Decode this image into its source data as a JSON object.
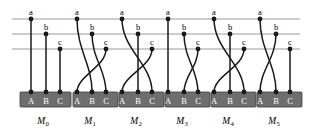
{
  "figure": {
    "type": "diagram",
    "colors": {
      "gridline": "#9b9b9b",
      "wire": "#1a1a1a",
      "node": "#1a1a1a",
      "bar_fill": "#6e6e6e",
      "bar_stroke": "#3c3c3c",
      "out_label": "#ffffff",
      "background": "#ffffff"
    },
    "grid": {
      "rows": 3,
      "row_y": [
        19,
        34,
        49
      ],
      "x_start": 12,
      "x_end": 300
    },
    "input_labels": [
      "a",
      "b",
      "c"
    ],
    "output_labels": [
      "A",
      "B",
      "C"
    ],
    "bar": {
      "top": 92,
      "height": 15
    },
    "modules": [
      {
        "name": "M",
        "subscript": "0",
        "label_x": 43,
        "inputs_x": [
          31,
          46,
          60
        ],
        "outputs_x": [
          31,
          46,
          60
        ],
        "bar_x": 20,
        "bar_width": 51,
        "mapping": [
          {
            "from": "a",
            "to": "A"
          },
          {
            "from": "b",
            "to": "B"
          },
          {
            "from": "c",
            "to": "C"
          }
        ]
      },
      {
        "name": "M",
        "subscript": "1",
        "label_x": 90,
        "inputs_x": [
          77,
          92,
          106
        ],
        "outputs_x": [
          77,
          92,
          106
        ],
        "bar_x": 73,
        "bar_width": 45,
        "mapping": [
          {
            "from": "a",
            "to": "B"
          },
          {
            "from": "b",
            "to": "C"
          },
          {
            "from": "c",
            "to": "A"
          }
        ]
      },
      {
        "name": "M",
        "subscript": "2",
        "label_x": 136,
        "inputs_x": [
          122,
          138,
          152
        ],
        "outputs_x": [
          122,
          138,
          152
        ],
        "bar_x": 119,
        "bar_width": 45,
        "mapping": [
          {
            "from": "a",
            "to": "C"
          },
          {
            "from": "b",
            "to": "B"
          },
          {
            "from": "c",
            "to": "A"
          }
        ]
      },
      {
        "name": "M",
        "subscript": "3",
        "label_x": 182,
        "inputs_x": [
          168,
          184,
          198
        ],
        "outputs_x": [
          168,
          184,
          198
        ],
        "bar_x": 165,
        "bar_width": 45,
        "mapping": [
          {
            "from": "a",
            "to": "A"
          },
          {
            "from": "b",
            "to": "C"
          },
          {
            "from": "c",
            "to": "B"
          }
        ]
      },
      {
        "name": "M",
        "subscript": "4",
        "label_x": 228,
        "inputs_x": [
          214,
          230,
          244
        ],
        "outputs_x": [
          214,
          230,
          244
        ],
        "bar_x": 211,
        "bar_width": 45,
        "mapping": [
          {
            "from": "a",
            "to": "C"
          },
          {
            "from": "b",
            "to": "B"
          },
          {
            "from": "c",
            "to": "A"
          }
        ]
      },
      {
        "name": "M",
        "subscript": "5",
        "label_x": 274,
        "inputs_x": [
          260,
          276,
          290
        ],
        "outputs_x": [
          260,
          276,
          290
        ],
        "bar_x": 257,
        "bar_width": 45,
        "mapping": [
          {
            "from": "a",
            "to": "B"
          },
          {
            "from": "b",
            "to": "A"
          },
          {
            "from": "c",
            "to": "C"
          }
        ]
      }
    ]
  }
}
